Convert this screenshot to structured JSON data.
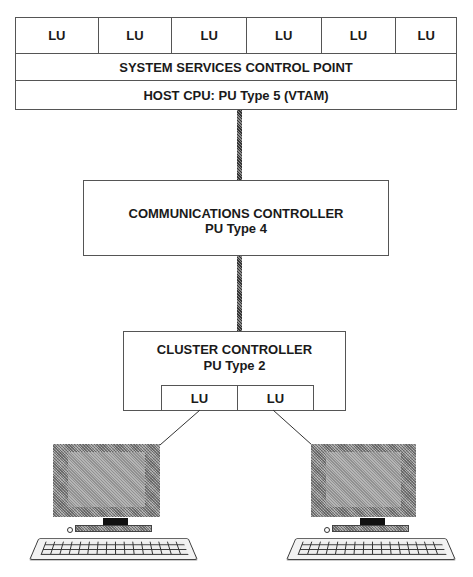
{
  "host": {
    "lu_cells": [
      "LU",
      "LU",
      "LU",
      "LU",
      "LU",
      "LU"
    ],
    "sscp_label": "SYSTEM  SERVICES CONTROL POINT",
    "host_label": "HOST  CPU:  PU Type 5 (VTAM)"
  },
  "communications_controller": {
    "title": "COMMUNICATIONS CONTROLLER",
    "subtitle": "PU Type 4"
  },
  "cluster_controller": {
    "title": "CLUSTER CONTROLLER",
    "subtitle": "PU Type 2",
    "lu_cells": [
      "LU",
      "LU"
    ]
  },
  "terminals": [
    {
      "icon": "terminal-icon"
    },
    {
      "icon": "terminal-icon"
    }
  ],
  "colors": {
    "line": "#555555",
    "monitor": "#9a9a9a",
    "stand": "#111111"
  }
}
